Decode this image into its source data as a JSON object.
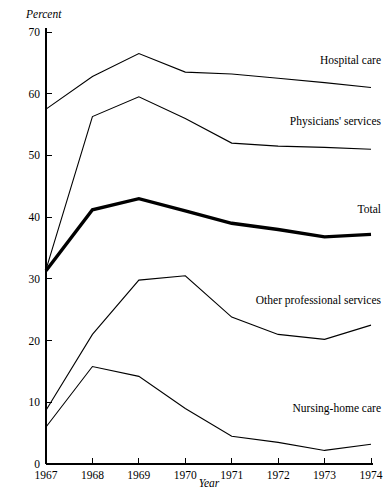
{
  "chart_data": {
    "type": "line",
    "title": "",
    "xlabel": "Year",
    "ylabel": "Percent",
    "x": [
      1967,
      1968,
      1969,
      1970,
      1971,
      1972,
      1973,
      1974
    ],
    "xtick_labels": [
      "1967",
      "1968",
      "1969",
      "1970",
      "1971",
      "1972",
      "1973",
      "1974"
    ],
    "ytick_labels": [
      "0",
      "10",
      "20",
      "30",
      "40",
      "50",
      "60",
      "70"
    ],
    "yticks": [
      0,
      10,
      20,
      30,
      40,
      50,
      60,
      70
    ],
    "ylim": [
      0,
      72
    ],
    "xlim": [
      1967,
      1974
    ],
    "grid": false,
    "legend_position": "inline-right",
    "series": [
      {
        "name": "Hospital care",
        "label": "Hospital care",
        "values": [
          57.5,
          62.8,
          66.5,
          63.5,
          63.2,
          62.5,
          61.8,
          61.0
        ],
        "emphasis": false,
        "label_x": 1974,
        "label_y": 65.5
      },
      {
        "name": "Physicians' services",
        "label": "Physicians' services",
        "values": [
          31.5,
          56.3,
          59.5,
          56.0,
          52.0,
          51.5,
          51.3,
          51.0
        ],
        "emphasis": false,
        "label_x": 1974,
        "label_y": 55.5
      },
      {
        "name": "Total",
        "label": "Total",
        "values": [
          31.3,
          41.2,
          43.0,
          41.0,
          39.0,
          38.0,
          36.8,
          37.2
        ],
        "emphasis": true,
        "label_x": 1974,
        "label_y": 41.3
      },
      {
        "name": "Other professional services",
        "label": "Other professional services",
        "values": [
          8.7,
          21.0,
          29.8,
          30.5,
          23.8,
          21.0,
          20.2,
          22.5
        ],
        "emphasis": false,
        "label_x": 1974,
        "label_y": 26.5
      },
      {
        "name": "Nursing-home care",
        "label": "Nursing-home care",
        "values": [
          6.0,
          15.8,
          14.2,
          9.0,
          4.5,
          3.5,
          2.2,
          3.2
        ],
        "emphasis": false,
        "label_x": 1974,
        "label_y": 9.0
      }
    ],
    "colors": {
      "line": "#000000",
      "axis": "#000000",
      "background": "#ffffff"
    }
  }
}
